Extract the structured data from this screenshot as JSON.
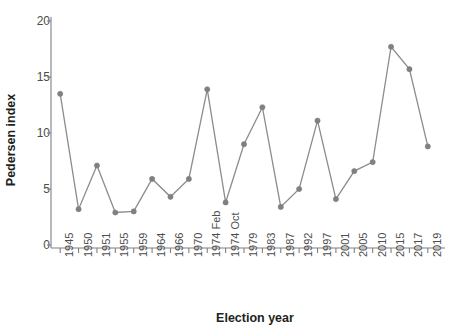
{
  "chart_data": {
    "type": "line",
    "title": "",
    "xlabel": "Election year",
    "ylabel": "Pedersen index",
    "categories": [
      "1945",
      "1950",
      "1951",
      "1955",
      "1959",
      "1964",
      "1966",
      "1970",
      "1974 Feb",
      "1974 Oct",
      "1979",
      "1983",
      "1987",
      "1992",
      "1997",
      "2001",
      "2005",
      "2010",
      "2015",
      "2017",
      "2019"
    ],
    "values": [
      13.5,
      3.2,
      7.1,
      2.9,
      3.0,
      5.9,
      4.3,
      5.9,
      13.9,
      3.8,
      9.0,
      12.3,
      3.4,
      5.0,
      11.1,
      4.1,
      6.6,
      7.4,
      17.7,
      15.7,
      8.8
    ],
    "series": [
      {
        "name": "Pedersen index",
        "values": [
          13.5,
          3.2,
          7.1,
          2.9,
          3.0,
          5.9,
          4.3,
          5.9,
          13.9,
          3.8,
          9.0,
          12.3,
          3.4,
          5.0,
          11.1,
          4.1,
          6.6,
          7.4,
          17.7,
          15.7,
          8.8
        ]
      }
    ],
    "yticks": [
      "0",
      "5",
      "10",
      "15",
      "20"
    ],
    "ytick_values": [
      0,
      5,
      10,
      15,
      20
    ],
    "ylim": [
      0,
      21
    ],
    "grid": false,
    "legend": "none",
    "line_color": "#8c8c8c",
    "marker_color": "#808080",
    "axis_color": "#808080",
    "text_color": "#4d4d4d",
    "label_color": "#231f20"
  }
}
